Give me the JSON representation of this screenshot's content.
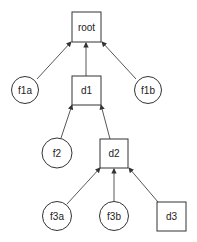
{
  "diagram": {
    "type": "tree",
    "nodes": [
      {
        "id": "root",
        "label": "root",
        "shape": "box"
      },
      {
        "id": "f1a",
        "label": "f1a",
        "shape": "circle"
      },
      {
        "id": "d1",
        "label": "d1",
        "shape": "box"
      },
      {
        "id": "f1b",
        "label": "f1b",
        "shape": "circle"
      },
      {
        "id": "f2",
        "label": "f2",
        "shape": "circle"
      },
      {
        "id": "d2",
        "label": "d2",
        "shape": "box"
      },
      {
        "id": "f3a",
        "label": "f3a",
        "shape": "circle"
      },
      {
        "id": "f3b",
        "label": "f3b",
        "shape": "circle"
      },
      {
        "id": "d3",
        "label": "d3",
        "shape": "box"
      }
    ],
    "edges": [
      {
        "from": "f1a",
        "to": "root"
      },
      {
        "from": "d1",
        "to": "root"
      },
      {
        "from": "f1b",
        "to": "root"
      },
      {
        "from": "f2",
        "to": "d1"
      },
      {
        "from": "d2",
        "to": "d1"
      },
      {
        "from": "f3a",
        "to": "d2"
      },
      {
        "from": "f3b",
        "to": "d2"
      },
      {
        "from": "d3",
        "to": "d2"
      }
    ]
  }
}
